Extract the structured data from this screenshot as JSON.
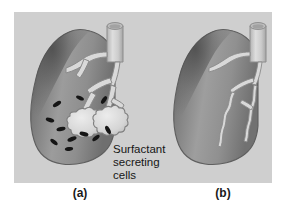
{
  "figure": {
    "panel": {
      "background_color": "#cfcfcf",
      "outer_background_color": "#ffffff"
    },
    "annotation": {
      "name": "surfactant-secreting-cells-label",
      "line1": "Surfactant",
      "line2": "secreting",
      "line3": "cells"
    },
    "captions": {
      "left": "(a)",
      "right": "(b)"
    },
    "panels": [
      {
        "id": "a",
        "caption": "(a)",
        "title": "normal-lung-with-surfactant",
        "description": "Lung in sagittal view with bronchus, branching bronchial tree, two open alveolar sacs and scattered dark surfactant secreting cells",
        "alveolar_sacs": 2,
        "secreting_cell_count": 11,
        "bronchus_open": true
      },
      {
        "id": "b",
        "caption": "(b)",
        "title": "collapsed-lung-without-surfactant",
        "description": "Lung in sagittal view with bronchus and thin collapsed wavy airway branches, no open alveolar sacs",
        "alveolar_sacs": 0,
        "secreting_cell_count": 0,
        "bronchus_open": true
      }
    ],
    "colors": {
      "panel_bg": "#cfcfcf",
      "lung_light": "#b9b9b9",
      "lung_mid": "#9a9a9a",
      "lung_dark": "#6d6d6d",
      "lung_darkest": "#4f4f4f",
      "airway_fill": "#d8d8d8",
      "airway_stroke": "#8a8a8a",
      "cell_fill": "#161616",
      "outline": "#6a6a6a",
      "text": "#161616"
    }
  }
}
